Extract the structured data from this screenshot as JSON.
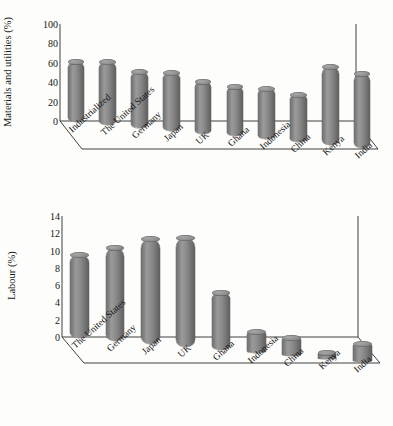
{
  "page": {
    "top_partial_text": "",
    "background_color": "#fdfdfb",
    "bar_color": "#808080"
  },
  "chart_data": [
    {
      "id": "materials",
      "type": "bar",
      "title": "",
      "ylabel": "Materials and utilities (%)",
      "xlabel": "",
      "ylim": [
        0,
        100
      ],
      "yticks": [
        0,
        20,
        40,
        60,
        80,
        100
      ],
      "grid": false,
      "legend": "none",
      "style": "3D cylinder bars",
      "categories": [
        "Industrialized",
        "The United States",
        "Germany",
        "Japan",
        "UK",
        "Ghana",
        "Indonesia",
        "China",
        "Kenya",
        "India"
      ],
      "values": [
        62,
        65,
        58,
        60,
        53,
        51,
        52,
        48,
        80,
        76
      ]
    },
    {
      "id": "labour",
      "type": "bar",
      "title": "",
      "ylabel": "Labour (%)",
      "xlabel": "",
      "ylim": [
        0,
        14
      ],
      "yticks": [
        0,
        2,
        4,
        6,
        8,
        10,
        12,
        14
      ],
      "grid": false,
      "legend": "none",
      "style": "3D cylinder bars",
      "categories": [
        "The United States",
        "Germany",
        "Japan",
        "UK",
        "Ghana",
        "Indonesia",
        "China",
        "Kenya",
        "India"
      ],
      "values": [
        9.6,
        10.8,
        12.2,
        12.6,
        6.6,
        2.4,
        2.0,
        0.6,
        2.0
      ]
    }
  ]
}
